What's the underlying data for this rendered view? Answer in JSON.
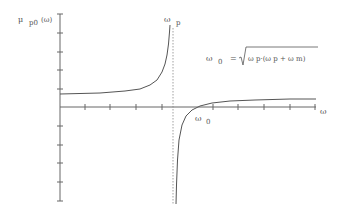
{
  "figure": {
    "y_axis_label": {
      "symbol": "μ",
      "subscript": "p0",
      "arg": "(ω)"
    },
    "x_axis_label": "ω",
    "pole_label": {
      "symbol": "ω",
      "subscript": "p"
    },
    "zero_label": {
      "symbol": "ω",
      "subscript": "0"
    },
    "formula": {
      "lhs": "ω",
      "lhs_sub": "0",
      "equals": "=",
      "rhs": "ω p·(ω p + ω m)"
    },
    "colors": {
      "axis": "#666666",
      "curve": "#555555",
      "dashed": "#888888",
      "background": "#ffffff"
    }
  }
}
